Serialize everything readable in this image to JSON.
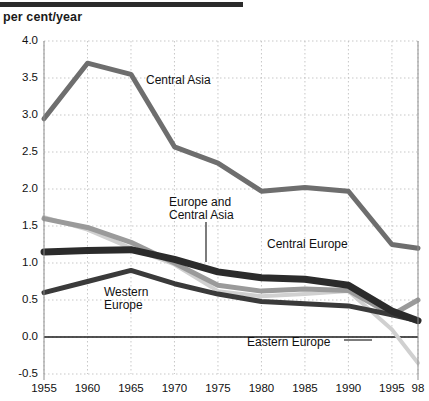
{
  "header": {
    "unit_label": "per cent/year"
  },
  "chart_data": {
    "type": "line",
    "title": "",
    "xlabel": "",
    "ylabel": "per cent/year",
    "x": [
      1955,
      1960,
      1965,
      1970,
      1975,
      1980,
      1985,
      1990,
      1995,
      1998
    ],
    "x_tick_labels": [
      "1955",
      "1960",
      "1965",
      "1970",
      "1975",
      "1980",
      "1985",
      "1990",
      "1995",
      "98"
    ],
    "y_tick_labels": [
      "4.0",
      "3.5",
      "3.0",
      "2.5",
      "2.0",
      "1.5",
      "1.0",
      "0.5",
      "0.0",
      "-0.5"
    ],
    "y_ticks": [
      4.0,
      3.5,
      3.0,
      2.5,
      2.0,
      1.5,
      1.0,
      0.5,
      0.0,
      -0.5
    ],
    "ylim": [
      -0.5,
      4.0
    ],
    "xlim": [
      1955,
      1998
    ],
    "grid": true,
    "legend": "inline-annotations",
    "zero_line": true,
    "series": [
      {
        "name": "Central Asia",
        "color": "#6e6e6e",
        "width": 5,
        "values": [
          2.95,
          3.7,
          3.55,
          2.57,
          2.35,
          1.97,
          2.02,
          1.97,
          1.25,
          1.2
        ]
      },
      {
        "name": "Europe and Central Asia",
        "color": "#2b2b2b",
        "width": 7,
        "values": [
          1.15,
          1.17,
          1.18,
          1.05,
          0.88,
          0.8,
          0.78,
          0.7,
          0.35,
          0.22
        ]
      },
      {
        "name": "Central Europe",
        "color": "#9a9a9a",
        "width": 5,
        "values": [
          1.6,
          1.48,
          1.28,
          1.0,
          0.7,
          0.62,
          0.65,
          0.63,
          0.3,
          0.5
        ]
      },
      {
        "name": "Western Europe",
        "color": "#3a3a3a",
        "width": 5,
        "values": [
          0.6,
          0.75,
          0.9,
          0.72,
          0.58,
          0.48,
          0.45,
          0.42,
          0.3,
          0.22
        ]
      },
      {
        "name": "Eastern Europe",
        "color": "#d0d0d0",
        "width": 4,
        "values": [
          1.62,
          1.45,
          1.2,
          0.98,
          0.62,
          0.55,
          0.58,
          0.62,
          0.1,
          -0.35
        ]
      }
    ],
    "annotations": [
      {
        "name": "central-asia",
        "text": "Central Asia",
        "x": 146,
        "y": 74
      },
      {
        "name": "europe-and-central-asia",
        "text": "Europe and\nCentral Asia",
        "x": 169,
        "y": 196
      },
      {
        "name": "central-europe",
        "text": "Central Europe",
        "x": 267,
        "y": 238
      },
      {
        "name": "western-europe",
        "text": "Western\nEurope",
        "x": 104,
        "y": 286
      },
      {
        "name": "eastern-europe",
        "text": "Eastern Europe",
        "x": 247,
        "y": 336
      }
    ]
  }
}
